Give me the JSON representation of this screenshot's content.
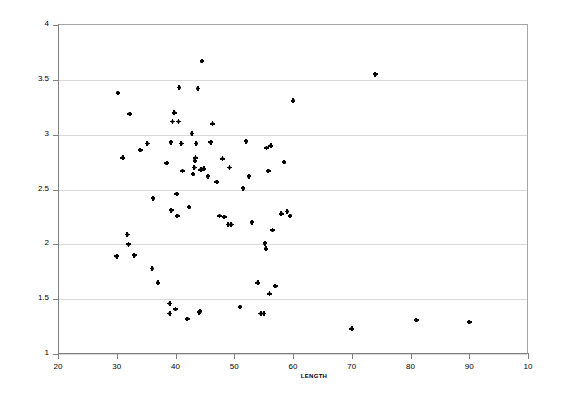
{
  "chart_data": {
    "type": "scatter",
    "title": "",
    "xlabel": "LENGTH",
    "ylabel": "WITH RATIO",
    "xlim": [
      20,
      100
    ],
    "ylim": [
      1,
      4
    ],
    "xticks": [
      20,
      30,
      40,
      50,
      60,
      70,
      80,
      90,
      100
    ],
    "xtick_labels": [
      "20",
      "30",
      "40",
      "50",
      "60",
      "70",
      "80",
      "90",
      "10"
    ],
    "yticks": [
      1,
      1.5,
      2,
      2.5,
      3,
      3.5,
      4
    ],
    "ytick_labels": [
      "1",
      "1.5",
      "2",
      "2.5",
      "3",
      "3.5",
      "4"
    ],
    "grid": "horizontal",
    "legend": "none",
    "marker": "filled-plus-dot",
    "marker_color": "#000000",
    "points": [
      [
        30.0,
        1.89
      ],
      [
        30.2,
        3.38
      ],
      [
        31.0,
        2.79
      ],
      [
        31.8,
        2.09
      ],
      [
        32.0,
        2.0
      ],
      [
        32.2,
        3.19
      ],
      [
        33.0,
        1.9
      ],
      [
        34.0,
        2.86
      ],
      [
        35.2,
        2.92
      ],
      [
        36.0,
        1.78
      ],
      [
        36.2,
        2.42
      ],
      [
        37.0,
        1.65
      ],
      [
        38.5,
        2.74
      ],
      [
        39.0,
        1.46
      ],
      [
        39.0,
        1.37
      ],
      [
        39.2,
        2.93
      ],
      [
        39.3,
        2.31
      ],
      [
        39.5,
        3.12
      ],
      [
        39.8,
        3.2
      ],
      [
        40.0,
        1.41
      ],
      [
        40.2,
        2.46
      ],
      [
        40.3,
        2.26
      ],
      [
        40.5,
        3.12
      ],
      [
        40.6,
        3.43
      ],
      [
        41.0,
        2.92
      ],
      [
        41.2,
        2.67
      ],
      [
        42.0,
        1.32
      ],
      [
        42.3,
        2.34
      ],
      [
        42.8,
        3.01
      ],
      [
        43.0,
        2.64
      ],
      [
        43.2,
        2.7
      ],
      [
        43.3,
        2.76
      ],
      [
        43.4,
        2.79
      ],
      [
        43.5,
        2.92
      ],
      [
        43.8,
        3.42
      ],
      [
        44.0,
        1.38
      ],
      [
        44.2,
        1.39
      ],
      [
        44.3,
        2.68
      ],
      [
        44.5,
        3.67
      ],
      [
        44.8,
        2.69
      ],
      [
        45.5,
        2.62
      ],
      [
        46.0,
        2.93
      ],
      [
        46.3,
        3.1
      ],
      [
        47.0,
        2.57
      ],
      [
        47.5,
        2.26
      ],
      [
        48.0,
        2.78
      ],
      [
        48.3,
        2.25
      ],
      [
        49.0,
        2.18
      ],
      [
        49.2,
        2.7
      ],
      [
        49.5,
        2.18
      ],
      [
        51.0,
        1.43
      ],
      [
        51.5,
        2.51
      ],
      [
        52.0,
        2.94
      ],
      [
        52.5,
        2.62
      ],
      [
        53.0,
        2.2
      ],
      [
        54.0,
        1.65
      ],
      [
        54.5,
        1.37
      ],
      [
        55.0,
        1.37
      ],
      [
        55.2,
        2.01
      ],
      [
        55.4,
        1.96
      ],
      [
        55.5,
        2.88
      ],
      [
        55.8,
        2.67
      ],
      [
        56.0,
        1.55
      ],
      [
        56.2,
        2.9
      ],
      [
        56.5,
        2.13
      ],
      [
        57.0,
        1.62
      ],
      [
        58.0,
        2.28
      ],
      [
        58.5,
        2.75
      ],
      [
        59.0,
        2.3
      ],
      [
        59.5,
        2.26
      ],
      [
        60.0,
        3.31
      ],
      [
        70.0,
        1.23
      ],
      [
        74.0,
        3.55
      ],
      [
        81.0,
        1.31
      ],
      [
        90.0,
        1.29
      ]
    ]
  }
}
